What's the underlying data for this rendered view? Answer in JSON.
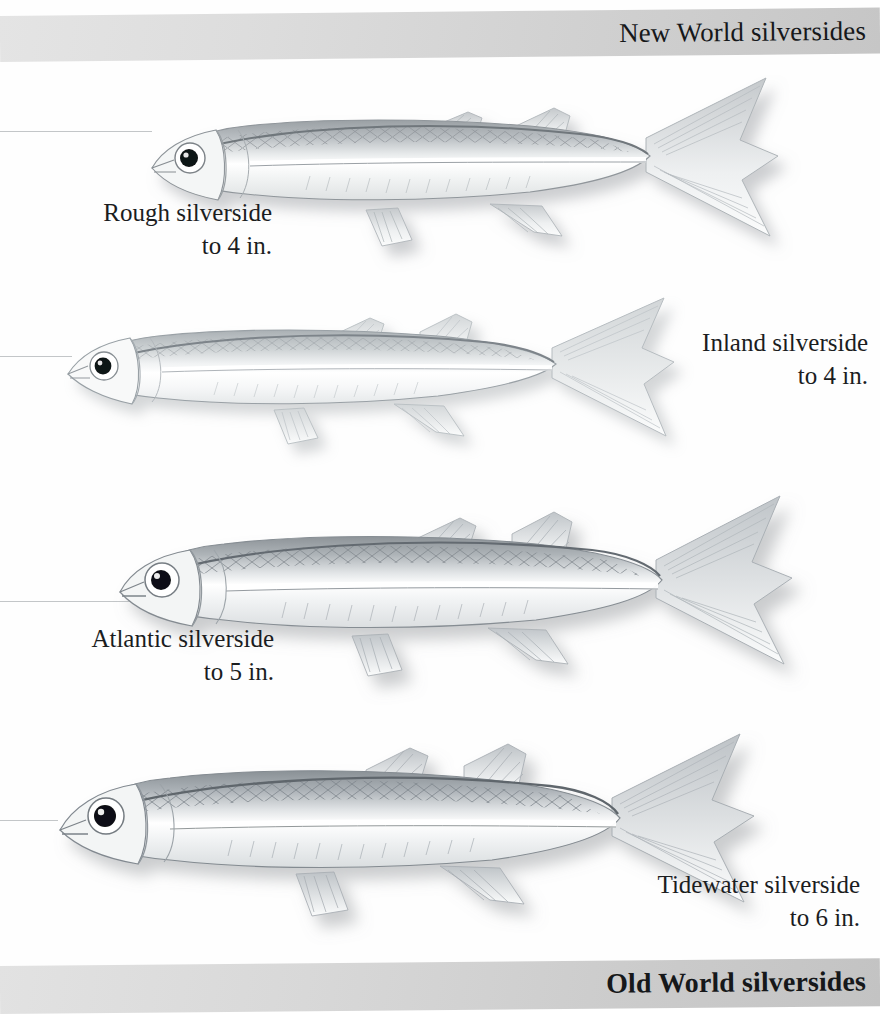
{
  "page": {
    "background_color": "#fefefe",
    "text_color": "#1b1d1f",
    "band_color": "#d4d4d4"
  },
  "header": {
    "title": "New World silversides"
  },
  "footer": {
    "title": "Old World silversides"
  },
  "species": [
    {
      "id": "rough-silverside",
      "name": "Rough silverside",
      "size": "to 4 in.",
      "caption": "Rough silverside\nto 4 in."
    },
    {
      "id": "inland-silverside",
      "name": "Inland silverside",
      "size": "to 4 in.",
      "caption": "Inland silverside\nto 4 in."
    },
    {
      "id": "atlantic-silverside",
      "name": "Atlantic silverside",
      "size": "to 5 in.",
      "caption": "Atlantic silverside\nto 5 in."
    },
    {
      "id": "tidewater-silverside",
      "name": "Tidewater silverside",
      "size": "to 6 in.",
      "caption": "Tidewater silverside\nto 6 in."
    }
  ],
  "illustrations": [
    {
      "id": "rough-silverside-illustration",
      "label": "Rough silverside illustration"
    },
    {
      "id": "inland-silverside-illustration",
      "label": "Inland silverside illustration"
    },
    {
      "id": "atlantic-silverside-illustration",
      "label": "Atlantic silverside illustration"
    },
    {
      "id": "tidewater-silverside-illustration",
      "label": "Tidewater silverside illustration"
    }
  ]
}
